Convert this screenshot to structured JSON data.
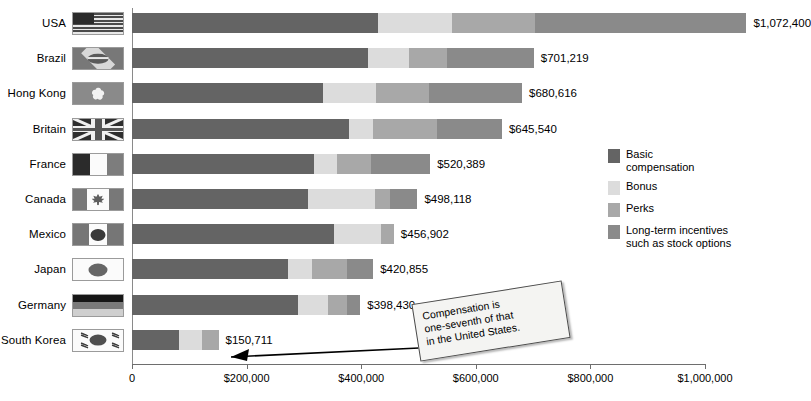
{
  "chart_data": {
    "type": "bar",
    "orientation": "horizontal",
    "stacked": true,
    "title": "",
    "xlabel": "",
    "ylabel": "",
    "xlim": [
      0,
      1000000
    ],
    "grid": false,
    "categories": [
      "USA",
      "Brazil",
      "Hong Kong",
      "Britain",
      "France",
      "Canada",
      "Mexico",
      "Japan",
      "Germany",
      "South Korea"
    ],
    "tick_labels": [
      "0",
      "$200,000",
      "$400,000",
      "$600,000",
      "$800,000",
      "$1,000,000"
    ],
    "tick_values": [
      0,
      200000,
      400000,
      600000,
      800000,
      1000000
    ],
    "series": [
      {
        "name": "Basic compensation",
        "color": "#646464",
        "values": [
          430000,
          412000,
          334000,
          378000,
          318000,
          308000,
          352000,
          272000,
          290000,
          82000
        ]
      },
      {
        "name": "Bonus",
        "color": "#dcdcdc",
        "values": [
          128000,
          72000,
          92000,
          42000,
          40000,
          116000,
          82000,
          42000,
          52000,
          40000
        ]
      },
      {
        "name": "Perks",
        "color": "#a8a8a8",
        "values": [
          146000,
          66000,
          92000,
          112000,
          60000,
          26000,
          23000,
          62000,
          34000,
          29000
        ]
      },
      {
        "name": "Long-term incentives such as stock options",
        "color": "#8a8a8a",
        "values": [
          368400,
          151219,
          162616,
          113540,
          102389,
          48118,
          0,
          44855,
          22430,
          0
        ]
      }
    ],
    "totals": [
      1072400,
      701219,
      680616,
      645540,
      520389,
      498118,
      456902,
      420855,
      398430,
      150711
    ],
    "value_labels": [
      "$1,072,400",
      "$701,219",
      "$680,616",
      "$645,540",
      "$520,389",
      "$498,118",
      "$456,902",
      "$420,855",
      "$398,430",
      "$150,711"
    ]
  },
  "legend": {
    "position": "right",
    "items": [
      {
        "label": "Basic\ncompensation",
        "color": "#646464"
      },
      {
        "label": "Bonus",
        "color": "#dcdcdc"
      },
      {
        "label": "Perks",
        "color": "#a8a8a8"
      },
      {
        "label": "Long-term incentives\nsuch as stock options",
        "color": "#8a8a8a"
      }
    ]
  },
  "annotation": {
    "text": "Compensation is\none-seventh of that\nin the United States."
  },
  "colors": {
    "basic": "#646464",
    "bonus": "#dcdcdc",
    "perks": "#a8a8a8",
    "lti": "#8a8a8a",
    "axis": "#6e6e6e",
    "flag_border": "#9b9b9b"
  }
}
